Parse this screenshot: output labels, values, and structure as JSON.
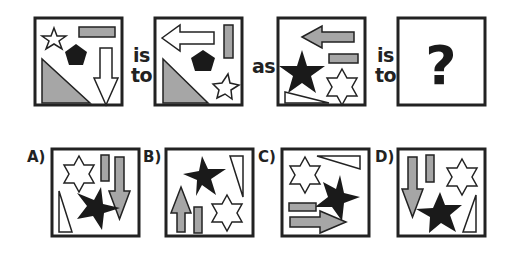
{
  "puzzle": {
    "connector_is": "is",
    "connector_to": "to",
    "connector_as": "as",
    "question_mark": "?",
    "colors": {
      "outline": "#222222",
      "gray_fill": "#a6a6a6",
      "black_fill": "#1a1a1a",
      "white_fill": "#ffffff"
    }
  },
  "options": [
    {
      "label": "A)"
    },
    {
      "label": "B)"
    },
    {
      "label": "C)"
    },
    {
      "label": "D)"
    }
  ]
}
